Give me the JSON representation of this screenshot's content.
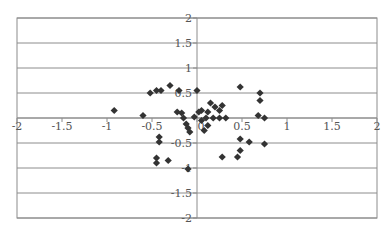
{
  "chart_data": {
    "type": "scatter",
    "title": "",
    "xlabel": "",
    "ylabel": "",
    "xlim": [
      -2,
      2
    ],
    "ylim": [
      -2,
      2
    ],
    "grid": {
      "horizontal": true,
      "vertical": false
    },
    "legend": null,
    "marker": "diamond",
    "x_ticks": [
      -2,
      -1.5,
      -1,
      -0.5,
      0,
      0.5,
      1,
      1.5,
      2
    ],
    "y_ticks": [
      -2,
      -1.5,
      -1,
      -0.5,
      0,
      0.5,
      1,
      1.5,
      2
    ],
    "x_tick_labels": [
      "-2",
      "-1.5",
      "-1",
      "-0.5",
      "0",
      "0.5",
      "1",
      "1.5",
      "2"
    ],
    "y_tick_labels": [
      "-2",
      "-1.5",
      "-1",
      "-0.5",
      "0",
      "0.5",
      "1",
      "1.5",
      "2"
    ],
    "series": [
      {
        "name": "points",
        "color": "#333333",
        "points": [
          [
            -0.92,
            0.15
          ],
          [
            -0.6,
            0.05
          ],
          [
            -0.52,
            0.5
          ],
          [
            -0.45,
            0.55
          ],
          [
            -0.4,
            0.55
          ],
          [
            -0.3,
            0.65
          ],
          [
            -0.22,
            0.12
          ],
          [
            -0.2,
            0.55
          ],
          [
            -0.17,
            0.1
          ],
          [
            -0.15,
            0.0
          ],
          [
            -0.12,
            -0.12
          ],
          [
            -0.1,
            -0.2
          ],
          [
            -0.08,
            -0.28
          ],
          [
            -0.03,
            0.02
          ],
          [
            0.0,
            0.55
          ],
          [
            0.02,
            0.12
          ],
          [
            0.05,
            0.15
          ],
          [
            0.05,
            -0.05
          ],
          [
            0.08,
            -0.25
          ],
          [
            0.1,
            0.0
          ],
          [
            0.12,
            0.12
          ],
          [
            0.12,
            -0.15
          ],
          [
            0.15,
            0.3
          ],
          [
            0.18,
            0.0
          ],
          [
            0.2,
            0.22
          ],
          [
            0.25,
            0.15
          ],
          [
            0.25,
            0.0
          ],
          [
            0.28,
            0.25
          ],
          [
            0.32,
            0.0
          ],
          [
            0.48,
            0.62
          ],
          [
            0.7,
            0.5
          ],
          [
            0.7,
            0.35
          ],
          [
            0.68,
            0.05
          ],
          [
            0.75,
            0.0
          ],
          [
            -0.42,
            -0.38
          ],
          [
            -0.42,
            -0.48
          ],
          [
            -0.45,
            -0.8
          ],
          [
            -0.45,
            -0.9
          ],
          [
            -0.32,
            -0.85
          ],
          [
            -0.1,
            -1.02
          ],
          [
            0.28,
            -0.78
          ],
          [
            0.45,
            -0.78
          ],
          [
            0.48,
            -0.65
          ],
          [
            0.48,
            -0.42
          ],
          [
            0.58,
            -0.48
          ],
          [
            0.75,
            -0.52
          ]
        ]
      }
    ]
  }
}
